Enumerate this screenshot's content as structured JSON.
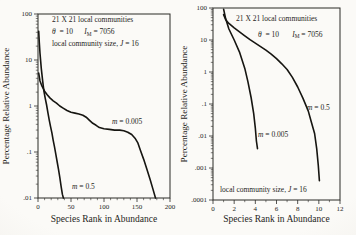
{
  "figure": {
    "bg": "#f7f5f0",
    "ink": "#161511",
    "frame_color": "#2b2a26"
  },
  "chart_data": [
    {
      "type": "line",
      "panel": "left",
      "title": "21 X 21 local communities",
      "xlabel": "Species Rank in Abundance",
      "ylabel": "Percentage Relative Abundance",
      "x": {
        "min": 0,
        "max": 200,
        "majors": [
          0,
          50,
          100,
          150,
          200
        ],
        "minor_step": 10
      },
      "y": {
        "log": true,
        "max_exp": 2,
        "min_exp": -2,
        "tick_labels": [
          "100",
          "10",
          "1",
          ".1",
          ".01"
        ]
      },
      "frame": {
        "left": 38,
        "top": 14,
        "right": 170,
        "bottom": 198
      },
      "xlabel_offset": 24,
      "ylabel_x": 9,
      "series": [
        {
          "name": "m = 0.005",
          "points": [
            [
              1,
              5.2
            ],
            [
              3,
              3.5
            ],
            [
              6,
              2.7
            ],
            [
              10,
              2.1
            ],
            [
              14,
              1.75
            ],
            [
              18,
              1.5
            ],
            [
              23,
              1.3
            ],
            [
              28,
              1.15
            ],
            [
              33,
              1.0
            ],
            [
              38,
              0.9
            ],
            [
              44,
              0.8
            ],
            [
              50,
              0.73
            ],
            [
              56,
              0.7
            ],
            [
              62,
              0.67
            ],
            [
              68,
              0.63
            ],
            [
              73,
              0.57
            ],
            [
              78,
              0.49
            ],
            [
              83,
              0.42
            ],
            [
              88,
              0.38
            ],
            [
              93,
              0.34
            ],
            [
              100,
              0.32
            ],
            [
              108,
              0.31
            ],
            [
              116,
              0.3
            ],
            [
              124,
              0.3
            ],
            [
              130,
              0.29
            ],
            [
              136,
              0.27
            ],
            [
              142,
              0.24
            ],
            [
              147,
              0.2
            ],
            [
              151,
              0.16
            ],
            [
              155,
              0.11
            ],
            [
              160,
              0.07
            ],
            [
              165,
              0.042
            ],
            [
              170,
              0.025
            ],
            [
              174,
              0.016
            ],
            [
              178,
              0.01
            ]
          ]
        },
        {
          "name": "m = 0.5",
          "points": [
            [
              1,
              42
            ],
            [
              2,
              24
            ],
            [
              3,
              14
            ],
            [
              5,
              6.5
            ],
            [
              7,
              3.6
            ],
            [
              9,
              2.1
            ],
            [
              11,
              1.45
            ],
            [
              13,
              1.05
            ],
            [
              15,
              0.72
            ],
            [
              17,
              0.5
            ],
            [
              19,
              0.36
            ],
            [
              21,
              0.26
            ],
            [
              23,
              0.18
            ],
            [
              25,
              0.13
            ],
            [
              27,
              0.09
            ],
            [
              29,
              0.062
            ],
            [
              31,
              0.042
            ],
            [
              33,
              0.028
            ],
            [
              35,
              0.018
            ],
            [
              37,
              0.012
            ],
            [
              38.5,
              0.01
            ]
          ]
        }
      ],
      "annotations": [
        {
          "id": "communities-note",
          "x": 52,
          "y": 21.5,
          "parts": [
            {
              "t": "21 X 21 local communities"
            }
          ]
        },
        {
          "id": "theta-note",
          "x": 52,
          "y": 34,
          "parts": [
            {
              "t": "θ",
              "i": 1
            },
            {
              "t": "  = 10      "
            },
            {
              "t": "I",
              "i": 1
            },
            {
              "t": "M",
              "sub": 1
            },
            {
              "t": " = 7056"
            }
          ]
        },
        {
          "id": "local-size-note",
          "x": 52,
          "y": 46,
          "parts": [
            {
              "t": "local community size, "
            },
            {
              "t": "J",
              "i": 1
            },
            {
              "t": " = 16"
            }
          ]
        },
        {
          "id": "label-m-0005",
          "x": 112,
          "y": 124,
          "parts": [
            {
              "t": "m",
              "i": 1
            },
            {
              "t": " = 0.005"
            }
          ]
        },
        {
          "id": "label-m-05",
          "x": 72,
          "y": 189,
          "parts": [
            {
              "t": "m",
              "i": 1
            },
            {
              "t": " = 0.5"
            }
          ]
        }
      ]
    },
    {
      "type": "line",
      "panel": "right",
      "title": "21 X 21 local communities",
      "xlabel": "Species Rank in Abundance",
      "ylabel": "Percentage Relative Abundance",
      "x": {
        "min": 0,
        "max": 12,
        "majors": [
          0,
          2,
          4,
          6,
          8,
          10,
          12
        ],
        "minor_step": 1
      },
      "y": {
        "log": true,
        "max_exp": 2,
        "min_exp": -4,
        "tick_labels": [
          "100",
          "10",
          "1",
          ".1",
          ".01",
          ".001",
          ".0001"
        ]
      },
      "frame": {
        "left": 35,
        "top": 8,
        "right": 162,
        "bottom": 200
      },
      "xlabel_offset": 22,
      "ylabel_x": 9,
      "series": [
        {
          "name": "m = 0.005",
          "points": [
            [
              1,
              92
            ],
            [
              1.2,
              46
            ],
            [
              1.5,
              22
            ],
            [
              2,
              10
            ],
            [
              2.5,
              4.2
            ],
            [
              3,
              1.3
            ],
            [
              3.3,
              0.5
            ],
            [
              3.6,
              0.16
            ],
            [
              3.85,
              0.05
            ],
            [
              4.0,
              0.018
            ],
            [
              4.1,
              0.007
            ],
            [
              4.2,
              0.004
            ]
          ]
        },
        {
          "name": "m = 0.5",
          "points": [
            [
              1,
              62
            ],
            [
              1.2,
              43
            ],
            [
              1.5,
              33
            ],
            [
              2,
              24
            ],
            [
              2.5,
              18
            ],
            [
              3,
              13.5
            ],
            [
              3.5,
              10.2
            ],
            [
              4,
              8
            ],
            [
              4.5,
              6.2
            ],
            [
              5,
              4.8
            ],
            [
              5.5,
              3.6
            ],
            [
              6,
              2.6
            ],
            [
              6.5,
              1.8
            ],
            [
              7,
              1.2
            ],
            [
              7.5,
              0.68
            ],
            [
              8,
              0.34
            ],
            [
              8.5,
              0.15
            ],
            [
              9,
              0.06
            ],
            [
              9.3,
              0.027
            ],
            [
              9.6,
              0.012
            ],
            [
              9.8,
              0.004
            ],
            [
              9.95,
              0.0012
            ],
            [
              10.05,
              0.0004
            ]
          ]
        }
      ],
      "annotations": [
        {
          "id": "communities-note",
          "x": 58,
          "y": 21,
          "parts": [
            {
              "t": "21 X 21  local communities"
            }
          ]
        },
        {
          "id": "theta-note",
          "x": 80,
          "y": 36.5,
          "parts": [
            {
              "t": "θ",
              "i": 1
            },
            {
              "t": "  = 10       "
            },
            {
              "t": "I",
              "i": 1
            },
            {
              "t": "M",
              "sub": 1
            },
            {
              "t": " = 7056"
            }
          ]
        },
        {
          "id": "label-m-05",
          "x": 129,
          "y": 110,
          "parts": [
            {
              "t": "m",
              "i": 1
            },
            {
              "t": " = 0.5"
            }
          ]
        },
        {
          "id": "label-m-0005",
          "x": 80,
          "y": 137,
          "parts": [
            {
              "t": "m",
              "i": 1
            },
            {
              "t": " = 0.005"
            }
          ]
        },
        {
          "id": "local-size-note",
          "x": 42,
          "y": 192,
          "parts": [
            {
              "t": "local community size, "
            },
            {
              "t": "J",
              "i": 1
            },
            {
              "t": " = 16"
            }
          ]
        }
      ]
    }
  ]
}
